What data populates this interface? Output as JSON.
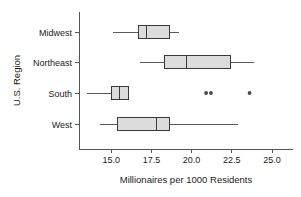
{
  "chart_data": {
    "type": "box",
    "title": "",
    "xlabel": "Millionaires per 1000 Residents",
    "ylabel": "U.S. Region",
    "orientation": "horizontal",
    "grid": false,
    "legend": null,
    "xlim": [
      13.0,
      26.3
    ],
    "xticks": [
      15.0,
      17.5,
      20.0,
      22.5,
      25.0
    ],
    "xticklabels": [
      "15.0",
      "17.5",
      "20.0",
      "22.5",
      "25.0"
    ],
    "categories": [
      "Midwest",
      "Northeast",
      "South",
      "West"
    ],
    "boxes": [
      {
        "category": "Midwest",
        "whisker_low": 15.1,
        "q1": 16.7,
        "median": 17.2,
        "q3": 18.6,
        "whisker_high": 19.2,
        "outliers": []
      },
      {
        "category": "Northeast",
        "whisker_low": 16.8,
        "q1": 18.3,
        "median": 19.7,
        "q3": 22.4,
        "whisker_high": 23.9,
        "outliers": []
      },
      {
        "category": "South",
        "whisker_low": 13.5,
        "q1": 15.0,
        "median": 15.5,
        "q3": 16.1,
        "whisker_high": 16.1,
        "outliers": [
          20.9,
          21.2,
          23.6
        ]
      },
      {
        "category": "West",
        "whisker_low": 14.3,
        "q1": 15.4,
        "median": 17.8,
        "q3": 18.6,
        "whisker_high": 22.9,
        "outliers": []
      }
    ],
    "colors": {
      "box_fill": "#dcdcdc",
      "box_edge": "#3a3a3a",
      "whisker": "#5a5a5a",
      "outlier": "#4a4a4a",
      "axis": "#555555",
      "text": "#1a1a1a",
      "background": "#ffffff"
    }
  }
}
